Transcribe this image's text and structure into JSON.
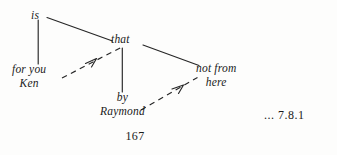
{
  "figure": {
    "type": "syntax-tree-diagram",
    "ink_color": "#1a1a1a",
    "background_color": "#fdfdfc",
    "nodes": {
      "is": "is",
      "that": "that",
      "for_you": "for you",
      "ken": "Ken",
      "not_from": "not from",
      "here": "here",
      "by": "by",
      "raymond": "Raymond"
    },
    "edges": [
      {
        "name": "is-to-that",
        "style": "solid",
        "from": "is",
        "to": "that",
        "x1": 47,
        "y1": 17,
        "x2": 112,
        "y2": 41
      },
      {
        "name": "is-to-for-you",
        "style": "solid",
        "from": "is",
        "to": "for you",
        "x1": 38,
        "y1": 20,
        "x2": 38,
        "y2": 64
      },
      {
        "name": "that-to-not-from",
        "style": "solid",
        "from": "that",
        "to": "not from",
        "x1": 143,
        "y1": 45,
        "x2": 199,
        "y2": 65
      },
      {
        "name": "that-to-by",
        "style": "solid",
        "from": "that",
        "to": "by",
        "x1": 122,
        "y1": 48,
        "x2": 122,
        "y2": 92
      }
    ],
    "movement_arrows": [
      {
        "name": "for-you-to-that",
        "style": "dashed",
        "from": "for you",
        "to": "that",
        "x1": 62,
        "y1": 78,
        "x2": 121,
        "y2": 48
      },
      {
        "name": "raymond-to-here",
        "style": "dashed",
        "from": "Raymond",
        "to": "here",
        "x1": 141,
        "y1": 110,
        "x2": 198,
        "y2": 78
      }
    ]
  },
  "page_number": "167",
  "example_reference": "... 7.8.1"
}
